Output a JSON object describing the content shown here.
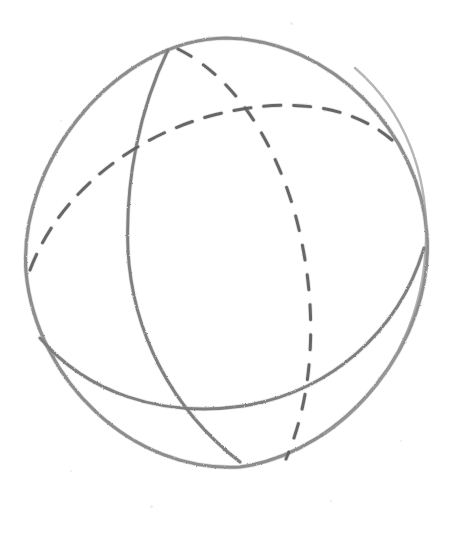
{
  "artwork": {
    "title": "Hand-drawn sphere with great circles",
    "medium": "pencil sketch",
    "background_color": "#ffffff",
    "canvas": {
      "width": 455,
      "height": 539
    }
  },
  "style": {
    "pencil_color": "#7b7b7b",
    "pencil_color_light": "#9a9a9a",
    "pencil_color_dark": "#606060",
    "stroke_width_outline": 3.1,
    "stroke_width_meridian": 2.9,
    "stroke_width_dashed": 3.0,
    "dash_pattern_equator": "17 13",
    "dash_pattern_meridian": "15 15"
  },
  "geometry": {
    "sphere": {
      "label": "sphere-outline",
      "kind": "circle",
      "center_x": 226,
      "center_y": 253,
      "radius_x": 201,
      "radius_y": 215,
      "rotation_deg": -4,
      "visible_edges": {
        "left_x": 25,
        "right_x": 428,
        "top_y": 38,
        "bottom_y": 468
      }
    },
    "curves": [
      {
        "label": "outline",
        "name": "sphere-outline-circle",
        "line_style": "solid",
        "description": "outer boundary circle of the sphere",
        "path": "M 226 38 C 332 40 420 132 427 235 C 434 340 347 452 240 467 C 133 473 36 381 26 272 C 18 160 118 39 226 38 Z"
      },
      {
        "label": "outline-overdraw",
        "name": "sphere-outline-overdraw",
        "line_style": "solid",
        "description": "faint second pass of the outline on the right arc",
        "path": "M 355 68 C 406 112 428 176 426 240 C 424 322 386 392 325 434"
      },
      {
        "label": "meridian-front",
        "name": "meridian-front-solid",
        "line_style": "solid",
        "description": "tilted great circle, front half, running from the top of the sphere down to the bottom through the left of centre",
        "path": "M 168 50 C 140 108 125 180 128 250 C 132 330 170 408 240 462"
      },
      {
        "label": "meridian-back",
        "name": "meridian-back-dashed",
        "line_style": "dashed",
        "description": "same tilted great circle, rear half, mirrored through the centre",
        "path": "M 178 49 C 232 76 272 136 294 210 C 317 292 318 384 286 459"
      },
      {
        "label": "equator-front",
        "name": "equator-front-solid",
        "line_style": "solid",
        "description": "horizontal great circle, front (lower) half, sweeping from the lower-left of the outline up to the right edge",
        "path": "M 40 338 C 86 392 160 418 243 406 C 330 392 399 332 424 248"
      },
      {
        "label": "equator-back",
        "name": "equator-back-dashed",
        "line_style": "dashed",
        "description": "horizontal great circle, rear (upper) half, from the left edge up through the centre to the right edge",
        "path": "M 30 270 C 56 200 124 140 210 116 C 286 96 350 104 392 140"
      }
    ],
    "intersections": [
      {
        "name": "north-pole-crossing",
        "x": 174,
        "y": 50
      },
      {
        "name": "dashed-crossing-upper",
        "x": 233,
        "y": 113
      },
      {
        "name": "front-meridian-dashed-equator",
        "x": 134,
        "y": 165
      },
      {
        "name": "front-equator-back-meridian",
        "x": 316,
        "y": 347
      },
      {
        "name": "front-equator-front-meridian",
        "x": 150,
        "y": 392
      },
      {
        "name": "south-pole-crossing",
        "x": 243,
        "y": 461
      }
    ]
  },
  "speckles": [
    {
      "x": 290,
      "y": 22,
      "size": 3
    },
    {
      "x": 60,
      "y": 120,
      "size": 2
    },
    {
      "x": 150,
      "y": 505,
      "size": 3
    },
    {
      "x": 400,
      "y": 440,
      "size": 2
    },
    {
      "x": 330,
      "y": 500,
      "size": 2
    },
    {
      "x": 70,
      "y": 470,
      "size": 2
    }
  ]
}
